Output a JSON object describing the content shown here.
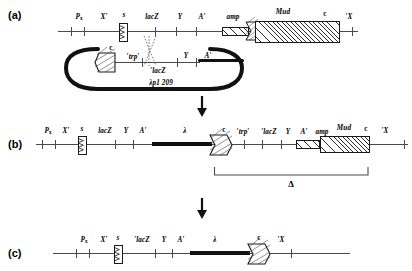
{
  "figure": {
    "panels": [
      {
        "id": "a",
        "label": "(a)"
      },
      {
        "id": "b",
        "label": "(b)"
      },
      {
        "id": "c",
        "label": "(c)"
      }
    ],
    "plasmid_name": "λp1 209",
    "deletion_symbol": "Δ",
    "lambda_symbol": "λ"
  },
  "panel_a": {
    "chromosome": {
      "genes": [
        {
          "name": "P",
          "sub": "x",
          "x": 79
        },
        {
          "name": "X′",
          "x": 104
        },
        {
          "name": "s",
          "x": 127
        },
        {
          "name": "lacZ",
          "x": 152
        },
        {
          "name": "Y",
          "x": 183
        },
        {
          "name": "A′",
          "x": 205
        },
        {
          "name": "amp",
          "x": 229
        },
        {
          "name": "Mud",
          "x": 277
        },
        {
          "name": "c",
          "x": 320
        },
        {
          "name": "′X",
          "x": 348
        }
      ]
    },
    "plasmid": {
      "name": "λp1 209",
      "genes": [
        {
          "name": "c",
          "x": 111
        },
        {
          "name": "′trp′",
          "x": 133
        },
        {
          "name": "′lacZ",
          "x": 157
        },
        {
          "name": "Y",
          "x": 186
        },
        {
          "name": "A′",
          "x": 208
        }
      ]
    }
  },
  "panel_b": {
    "chromosome": {
      "genes": [
        {
          "name": "P",
          "sub": "x",
          "x": 55
        },
        {
          "name": "X′",
          "x": 73
        },
        {
          "name": "s",
          "x": 89
        },
        {
          "name": "lacZ",
          "x": 110
        },
        {
          "name": "Y",
          "x": 134
        },
        {
          "name": "A′",
          "x": 150
        },
        {
          "name": "λ",
          "x": 190
        },
        {
          "name": "c",
          "x": 230
        },
        {
          "name": "′trp′",
          "x": 246
        },
        {
          "name": "′lacZ",
          "x": 271
        },
        {
          "name": "Y",
          "x": 290
        },
        {
          "name": "A′",
          "x": 307
        },
        {
          "name": "amp",
          "x": 325
        },
        {
          "name": "Mud",
          "x": 357
        },
        {
          "name": "c",
          "x": 385
        },
        {
          "name": "′X",
          "x": 399
        }
      ]
    },
    "deletion": {
      "symbol": "Δ"
    }
  },
  "panel_c": {
    "chromosome": {
      "genes": [
        {
          "name": "P",
          "sub": "x",
          "x": 84
        },
        {
          "name": "X′",
          "x": 105
        },
        {
          "name": "s",
          "x": 122
        },
        {
          "name": "′lacZ",
          "x": 145
        },
        {
          "name": "Y",
          "x": 167
        },
        {
          "name": "A′",
          "x": 185
        },
        {
          "name": "λ",
          "x": 216
        },
        {
          "name": "c",
          "x": 260
        },
        {
          "name": "′X",
          "x": 285
        }
      ]
    }
  }
}
